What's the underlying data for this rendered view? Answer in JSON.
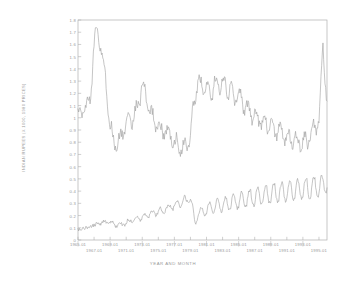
{
  "chart_data": {
    "type": "line",
    "title": "",
    "xlabel": "YEAR AND MONTH",
    "ylabel": "INDIAN RUPEES (X 1000, 1980 PRICES)",
    "ylim": [
      0,
      1.8
    ],
    "yticks": [
      "0",
      "0.1",
      "0.2",
      "0.3",
      "0.4",
      "0.5",
      "0.6",
      "0.7",
      "0.8",
      "0.9",
      "1",
      "1.1",
      "1.2",
      "1.3",
      "1.4",
      "1.5",
      "1.6",
      "1.7",
      "1.8"
    ],
    "xlim": [
      "1965.01",
      "1995.12"
    ],
    "xticks_upper": [
      "1965.01",
      "1969.01",
      "1973.01",
      "1977.01",
      "1981.01",
      "1985.01",
      "1989.01",
      "1993.01"
    ],
    "xticks_lower": [
      "1967.01",
      "1971.01",
      "1975.01",
      "1979.01",
      "1983.01",
      "1987.01",
      "1991.01",
      "1995.01"
    ],
    "grid": false,
    "legend": "none",
    "line_color": "#9d9d9d",
    "frame_color": "#b0b0b0",
    "x": [
      "1965.01",
      "1965.07",
      "1966.01",
      "1966.07",
      "1967.01",
      "1967.07",
      "1968.01",
      "1968.07",
      "1969.01",
      "1969.07",
      "1970.01",
      "1970.07",
      "1971.01",
      "1971.07",
      "1972.01",
      "1972.07",
      "1973.01",
      "1973.07",
      "1974.01",
      "1974.07",
      "1975.01",
      "1975.07",
      "1976.01",
      "1976.07",
      "1977.01",
      "1977.07",
      "1978.01",
      "1978.07",
      "1979.01",
      "1979.07",
      "1980.01",
      "1980.07",
      "1981.01",
      "1981.07",
      "1982.01",
      "1982.07",
      "1983.01",
      "1983.07",
      "1984.01",
      "1984.07",
      "1985.01",
      "1985.07",
      "1986.01",
      "1986.07",
      "1987.01",
      "1987.07",
      "1988.01",
      "1988.07",
      "1989.01",
      "1989.07",
      "1990.01",
      "1990.07",
      "1991.01",
      "1991.07",
      "1992.01",
      "1992.07",
      "1993.01",
      "1993.07",
      "1994.01",
      "1994.07",
      "1995.01",
      "1995.07",
      "1995.12"
    ],
    "series": [
      {
        "name": "upper-series",
        "values": [
          1.06,
          1.04,
          1.1,
          1.12,
          1.62,
          1.7,
          1.54,
          1.28,
          0.94,
          0.78,
          0.8,
          0.86,
          0.96,
          0.98,
          1.02,
          1.1,
          1.28,
          1.14,
          1.04,
          0.98,
          0.92,
          0.88,
          0.9,
          0.86,
          0.8,
          0.78,
          0.74,
          0.78,
          0.88,
          1.14,
          1.32,
          1.22,
          1.26,
          1.18,
          1.3,
          1.24,
          1.34,
          1.2,
          1.28,
          1.14,
          1.22,
          1.08,
          1.12,
          1.0,
          1.04,
          0.96,
          1.0,
          0.92,
          0.96,
          0.88,
          0.92,
          0.84,
          0.88,
          0.8,
          0.84,
          0.78,
          0.82,
          0.8,
          0.86,
          0.92,
          1.0,
          1.58,
          1.1
        ]
      },
      {
        "name": "lower-series",
        "values": [
          0.08,
          0.09,
          0.1,
          0.11,
          0.12,
          0.13,
          0.14,
          0.15,
          0.14,
          0.13,
          0.12,
          0.13,
          0.14,
          0.16,
          0.17,
          0.18,
          0.19,
          0.2,
          0.21,
          0.22,
          0.23,
          0.24,
          0.26,
          0.27,
          0.28,
          0.3,
          0.31,
          0.33,
          0.34,
          0.16,
          0.2,
          0.26,
          0.22,
          0.3,
          0.24,
          0.32,
          0.25,
          0.34,
          0.26,
          0.36,
          0.27,
          0.38,
          0.28,
          0.4,
          0.29,
          0.42,
          0.3,
          0.44,
          0.31,
          0.45,
          0.32,
          0.46,
          0.33,
          0.47,
          0.34,
          0.48,
          0.35,
          0.49,
          0.36,
          0.5,
          0.37,
          0.51,
          0.42
        ]
      }
    ]
  }
}
